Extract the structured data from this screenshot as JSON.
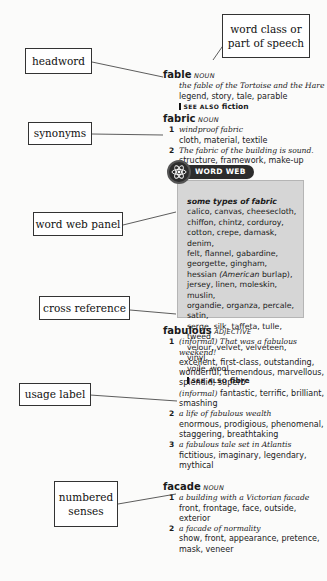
{
  "callouts": {
    "headword": "headword",
    "word_class": "word class or part of speech",
    "synonyms": "synonyms",
    "word_web_panel": "word web panel",
    "cross_reference": "cross reference",
    "usage_label": "usage label",
    "numbered_senses_1": "numbered",
    "numbered_senses_2": "senses"
  },
  "entries": {
    "fable": {
      "headword": "fable",
      "pos": "noun",
      "example": "the fable of the Tortoise and the Hare",
      "synonyms": "legend, story, tale, parable",
      "see_also_label": "see also",
      "see_also_target": "fiction"
    },
    "fabric": {
      "headword": "fabric",
      "pos": "noun",
      "senses": [
        {
          "num": "1",
          "example": "windproof fabric",
          "synonyms": "cloth, material, textile"
        },
        {
          "num": "2",
          "example": "The fabric of the building is sound.",
          "synonyms": "structure, framework, make-up"
        }
      ],
      "word_web": {
        "tab_label": "WORD WEB",
        "heading": "some types of fabric",
        "lines": [
          "calico, canvas, cheesecloth,",
          "chiffon, chintz, corduroy,",
          "cotton, crepe, damask, denim,",
          "felt, flannel, gabardine,",
          "georgette, gingham,"
        ],
        "hessian": "hessian",
        "hessian_note": "(American",
        "hessian_note2": "burlap),",
        "lines2": [
          "jersey, linen, moleskin, muslin,",
          "organdie, organza, percale, satin,",
          "serge, silk, taffeta, tulle, tweed,",
          "velour, velvet, velveteen, vinyl,",
          "voile, wool"
        ],
        "see_also_label": "see also",
        "see_also_target": "fibre"
      }
    },
    "fabulous": {
      "headword": "fabulous",
      "pos": "adjective",
      "senses": [
        {
          "num": "1",
          "label": "(informal)",
          "example": "That was a fabulous weekend!",
          "synonyms": "excellent, first-class, outstanding, wonderful, tremendous, marvellous, splendid, superb",
          "informal_label": "(informal)",
          "informal_synonyms": "fantastic, terrific, brilliant, smashing"
        },
        {
          "num": "2",
          "example": "a life of fabulous wealth",
          "synonyms": "enormous, prodigious, phenomenal, staggering, breathtaking"
        },
        {
          "num": "3",
          "example": "a fabulous tale set in Atlantis",
          "synonyms": "fictitious, imaginary, legendary, mythical"
        }
      ]
    },
    "facade": {
      "headword": "facade",
      "pos": "noun",
      "senses": [
        {
          "num": "1",
          "example": "a building with a Victorian facade",
          "synonyms": "front, frontage, face, outside, exterior"
        },
        {
          "num": "2",
          "example": "a facade of normality",
          "synonyms": "show, front, appearance, pretence, mask, veneer"
        }
      ]
    }
  }
}
